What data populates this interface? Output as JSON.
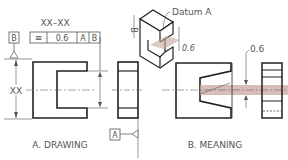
{
  "drawing": {
    "caption": "A. DRAWING",
    "section_label": "XX–XX",
    "datum_b": "B",
    "datum_a": "A",
    "dimension": "XX",
    "fcf": {
      "symbol": "≡",
      "tolerance": "0.6",
      "datum1": "A",
      "datum2": "B"
    }
  },
  "meaning": {
    "caption": "B. MEANING",
    "datum_callout": "Datum  A",
    "iso_b_label": "B",
    "iso_tol": "0.6",
    "tol_zone": "0.6",
    "zone_color": "#c9a59f"
  }
}
